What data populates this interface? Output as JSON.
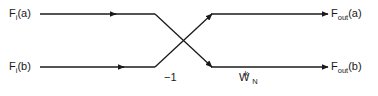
{
  "diagram": {
    "type": "butterfly-signal-flow-graph",
    "background_color": "#ffffff",
    "line_color": "#1a1a1a",
    "text_color": "#1a1a1a",
    "inputs": [
      {
        "id": "fi-a",
        "base": "F",
        "subscript": "i",
        "argument": "(a)",
        "full_text": "Fi(a)"
      },
      {
        "id": "fi-b",
        "base": "F",
        "subscript": "i",
        "argument": "(b)",
        "full_text": "Fi(b)"
      }
    ],
    "outputs": [
      {
        "id": "fout-a",
        "base": "F",
        "subscript": "out",
        "argument": "(a)",
        "full_text": "Fout(a)"
      },
      {
        "id": "fout-b",
        "base": "F",
        "subscript": "out",
        "argument": "(b)",
        "full_text": "Fout(b)"
      }
    ],
    "edge_labels": [
      {
        "id": "minus-one",
        "text": "−1"
      },
      {
        "id": "twiddle-factor",
        "base": "W",
        "subscript": "N",
        "superscript": "k",
        "full_text": "WNk"
      }
    ]
  }
}
